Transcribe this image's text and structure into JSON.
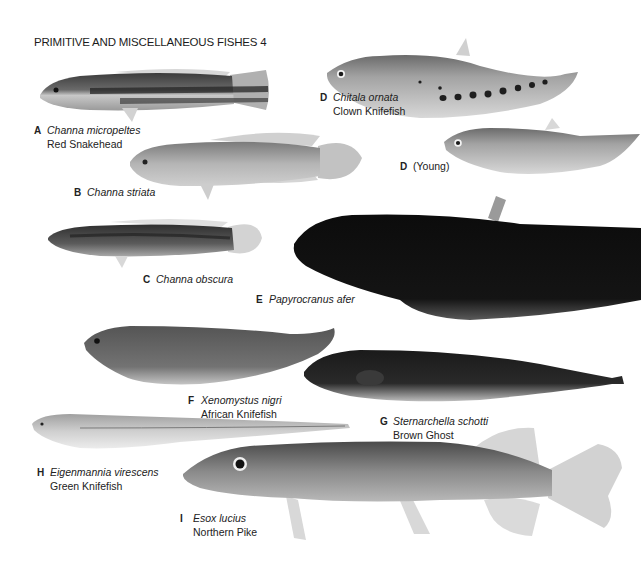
{
  "page": {
    "title": "PRIMITIVE AND MISCELLANEOUS FISHES 4",
    "palette": {
      "background": "#ffffff",
      "text": "#1c1c1c"
    }
  },
  "fishes": [
    {
      "letter": "A",
      "scientific": "Channa micropeltes",
      "common": "Red Snakehead",
      "tone": "#5a5a5a"
    },
    {
      "letter": "B",
      "scientific": "Channa striata",
      "common": "",
      "tone": "#9a9a9a"
    },
    {
      "letter": "C",
      "scientific": "Channa obscura",
      "common": "",
      "tone": "#575757"
    },
    {
      "letter": "D",
      "scientific": "Chitala ornata",
      "common": "Clown Knifefish",
      "tone": "#a6a6a6"
    },
    {
      "letter": "D",
      "scientific": "",
      "common": "",
      "note": "(Young)",
      "tone": "#a3a3a3"
    },
    {
      "letter": "E",
      "scientific": "Papyrocranus afer",
      "common": "",
      "tone": "#111111"
    },
    {
      "letter": "F",
      "scientific": "Xenomystus nigri",
      "common": "African Knifefish",
      "tone": "#6e6e6e"
    },
    {
      "letter": "G",
      "scientific": "Sternarchella schotti",
      "common": "Brown Ghost",
      "tone": "#262626"
    },
    {
      "letter": "H",
      "scientific": "Eigenmannia virescens",
      "common": "Green Knifefish",
      "tone": "#c4c4c4"
    },
    {
      "letter": "I",
      "scientific": "Esox lucius",
      "common": "Northern Pike",
      "tone": "#7d7d7d"
    }
  ]
}
